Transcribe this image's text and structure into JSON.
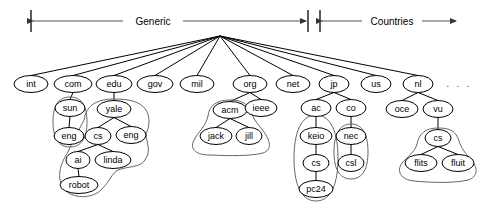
{
  "figure": {
    "width": 481,
    "height": 215,
    "background": "#ffffff",
    "line_color": "#000000",
    "zone_outline_color": "#666666",
    "span_color": "#555555"
  },
  "spans": [
    {
      "name": "generic-span",
      "label": "Generic",
      "x1": 31,
      "x2": 308,
      "y": 21,
      "label_x": 153,
      "arrow_left": true,
      "arrow_right": true,
      "bar_left": true,
      "bar_right": true
    },
    {
      "name": "countries-span",
      "label": "Countries",
      "x1": 320,
      "x2": 458,
      "y": 21,
      "label_x": 392,
      "arrow_left": true,
      "arrow_right": true,
      "bar_left": true,
      "bar_right": false
    }
  ],
  "root": {
    "name": "root-node",
    "x": 220,
    "y": 36
  },
  "ellipsis": {
    "label": ". . .",
    "x": 459,
    "y": 84
  },
  "nodes": [
    {
      "id": "int",
      "label": "int",
      "x": 31,
      "y": 84,
      "rx": 17,
      "ry": 8.5
    },
    {
      "id": "com",
      "label": "com",
      "x": 73,
      "y": 84,
      "rx": 19,
      "ry": 8.5
    },
    {
      "id": "edu",
      "label": "edu",
      "x": 114,
      "y": 84,
      "rx": 18,
      "ry": 8.5
    },
    {
      "id": "gov",
      "label": "gov",
      "x": 155,
      "y": 84,
      "rx": 18,
      "ry": 8.5
    },
    {
      "id": "mil",
      "label": "mil",
      "x": 197,
      "y": 84,
      "rx": 17,
      "ry": 8.5
    },
    {
      "id": "org",
      "label": "org",
      "x": 250,
      "y": 84,
      "rx": 17,
      "ry": 8.5
    },
    {
      "id": "net",
      "label": "net",
      "x": 293,
      "y": 84,
      "rx": 17,
      "ry": 8.5
    },
    {
      "id": "jp",
      "label": "jp",
      "x": 334,
      "y": 84,
      "rx": 15,
      "ry": 8.5
    },
    {
      "id": "us",
      "label": "us",
      "x": 376,
      "y": 84,
      "rx": 15,
      "ry": 8.5
    },
    {
      "id": "nl",
      "label": "nl",
      "x": 418,
      "y": 84,
      "rx": 15,
      "ry": 8.5
    },
    {
      "id": "sun",
      "label": "sun",
      "x": 70,
      "y": 108,
      "rx": 15,
      "ry": 8.5
    },
    {
      "id": "yale",
      "label": "yale",
      "x": 114,
      "y": 109,
      "rx": 17,
      "ry": 8.5
    },
    {
      "id": "acm",
      "label": "acm",
      "x": 230,
      "y": 110,
      "rx": 17,
      "ry": 8.5
    },
    {
      "id": "ieee",
      "label": "ieee",
      "x": 261,
      "y": 108,
      "rx": 16,
      "ry": 8.5
    },
    {
      "id": "ac",
      "label": "ac",
      "x": 316,
      "y": 108,
      "rx": 15,
      "ry": 8.5
    },
    {
      "id": "co",
      "label": "co",
      "x": 351,
      "y": 108,
      "rx": 15,
      "ry": 8.5
    },
    {
      "id": "oce",
      "label": "oce",
      "x": 402,
      "y": 109,
      "rx": 16,
      "ry": 8.5
    },
    {
      "id": "vu",
      "label": "vu",
      "x": 438,
      "y": 109,
      "rx": 15,
      "ry": 8.5
    },
    {
      "id": "eng1",
      "label": "eng",
      "x": 69,
      "y": 136,
      "rx": 15,
      "ry": 8.5
    },
    {
      "id": "cs1",
      "label": "cs",
      "x": 98,
      "y": 136,
      "rx": 13,
      "ry": 8.5
    },
    {
      "id": "eng2",
      "label": "eng",
      "x": 131,
      "y": 135,
      "rx": 15,
      "ry": 8.5
    },
    {
      "id": "jack",
      "label": "jack",
      "x": 216,
      "y": 136,
      "rx": 16,
      "ry": 8.5
    },
    {
      "id": "jill",
      "label": "jill",
      "x": 249,
      "y": 136,
      "rx": 13,
      "ry": 8.5
    },
    {
      "id": "keio",
      "label": "keio",
      "x": 316,
      "y": 136,
      "rx": 16,
      "ry": 8.5
    },
    {
      "id": "nec",
      "label": "nec",
      "x": 351,
      "y": 136,
      "rx": 15,
      "ry": 8.5
    },
    {
      "id": "cs3",
      "label": "cs",
      "x": 438,
      "y": 138,
      "rx": 13,
      "ry": 8.5
    },
    {
      "id": "ai",
      "label": "ai",
      "x": 78,
      "y": 160,
      "rx": 12,
      "ry": 8.5
    },
    {
      "id": "linda",
      "label": "linda",
      "x": 113,
      "y": 160,
      "rx": 18,
      "ry": 8.5
    },
    {
      "id": "cs2",
      "label": "cs",
      "x": 316,
      "y": 163,
      "rx": 13,
      "ry": 8.5
    },
    {
      "id": "csl",
      "label": "csl",
      "x": 351,
      "y": 163,
      "rx": 13,
      "ry": 8.5
    },
    {
      "id": "flits",
      "label": "flits",
      "x": 421,
      "y": 163,
      "rx": 16,
      "ry": 8.5
    },
    {
      "id": "fluit",
      "label": "fluit",
      "x": 458,
      "y": 163,
      "rx": 16,
      "ry": 8.5
    },
    {
      "id": "robot",
      "label": "robot",
      "x": 79,
      "y": 185,
      "rx": 19,
      "ry": 8.5
    },
    {
      "id": "pc24",
      "label": "pc24",
      "x": 316,
      "y": 189,
      "rx": 17,
      "ry": 8.5
    }
  ],
  "edges": [
    {
      "from": "root",
      "to": "int"
    },
    {
      "from": "root",
      "to": "com"
    },
    {
      "from": "root",
      "to": "edu"
    },
    {
      "from": "root",
      "to": "gov"
    },
    {
      "from": "root",
      "to": "mil"
    },
    {
      "from": "root",
      "to": "org"
    },
    {
      "from": "root",
      "to": "net"
    },
    {
      "from": "root",
      "to": "jp"
    },
    {
      "from": "root",
      "to": "us"
    },
    {
      "from": "root",
      "to": "nl"
    },
    {
      "from": "com",
      "to": "sun"
    },
    {
      "from": "edu",
      "to": "yale"
    },
    {
      "from": "org",
      "to": "acm"
    },
    {
      "from": "org",
      "to": "ieee"
    },
    {
      "from": "jp",
      "to": "ac"
    },
    {
      "from": "jp",
      "to": "co"
    },
    {
      "from": "nl",
      "to": "oce"
    },
    {
      "from": "nl",
      "to": "vu"
    },
    {
      "from": "sun",
      "to": "eng1"
    },
    {
      "from": "yale",
      "to": "cs1"
    },
    {
      "from": "yale",
      "to": "eng2"
    },
    {
      "from": "acm",
      "to": "jack"
    },
    {
      "from": "acm",
      "to": "jill"
    },
    {
      "from": "ac",
      "to": "keio"
    },
    {
      "from": "co",
      "to": "nec"
    },
    {
      "from": "vu",
      "to": "cs3"
    },
    {
      "from": "cs1",
      "to": "ai"
    },
    {
      "from": "cs1",
      "to": "linda"
    },
    {
      "from": "keio",
      "to": "cs2"
    },
    {
      "from": "nec",
      "to": "csl"
    },
    {
      "from": "cs3",
      "to": "flits"
    },
    {
      "from": "cs3",
      "to": "fluit"
    },
    {
      "from": "ai",
      "to": "robot"
    },
    {
      "from": "cs2",
      "to": "pc24"
    }
  ],
  "zones": [
    {
      "name": "zone-sun-eng",
      "members": [
        "sun",
        "eng1"
      ],
      "path": "M 70 97 C 57 97 53 108 53 122 C 53 137 58 147 70 147 C 82 147 87 137 87 122 C 87 108 83 97 70 97 Z"
    },
    {
      "name": "zone-yale-cs-ai-linda-robot",
      "members": [
        "yale",
        "cs1",
        "eng2",
        "ai",
        "linda",
        "robot"
      ],
      "path": "M 114 99 C 96 99 86 106 84 120 C 80 128 72 142 68 152 C 60 164 56 178 64 189 C 72 199 92 199 101 190 C 110 181 112 173 118 170 C 128 166 140 168 145 160 C 152 150 146 142 146 134 C 150 126 150 116 146 110 C 140 101 128 99 114 99 Z"
    },
    {
      "name": "zone-acm-jack-jill",
      "members": [
        "acm",
        "jack",
        "jill"
      ],
      "path": "M 230 100 C 216 100 209 106 208 116 C 206 126 198 132 194 140 C 189 150 197 155 210 155 C 230 156 252 156 263 153 C 272 150 270 142 266 135 C 260 126 254 121 252 114 C 249 104 242 100 230 100 Z"
    },
    {
      "name": "zone-ac-keio-cs-pc24",
      "members": [
        "ac",
        "keio",
        "cs2",
        "pc24"
      ],
      "path": "M 316 115 C 300 115 294 135 294 158 C 294 182 300 201 316 201 C 332 201 338 182 338 158 C 338 135 332 115 316 115 Z"
    },
    {
      "name": "zone-nec-csl",
      "members": [
        "nec",
        "csl"
      ],
      "path": "M 351 124 C 338 124 334 137 334 152 C 334 168 339 179 351 179 C 363 179 368 168 368 152 C 368 137 364 124 351 124 Z"
    },
    {
      "name": "zone-cs-flits-fluit",
      "members": [
        "cs3",
        "flits",
        "fluit"
      ],
      "path": "M 438 128 C 425 128 419 134 417 144 C 415 152 407 157 402 163 C 396 171 401 180 414 181 C 434 183 456 183 468 180 C 478 177 478 168 472 161 C 466 154 461 148 459 141 C 456 131 450 128 438 128 Z"
    }
  ]
}
